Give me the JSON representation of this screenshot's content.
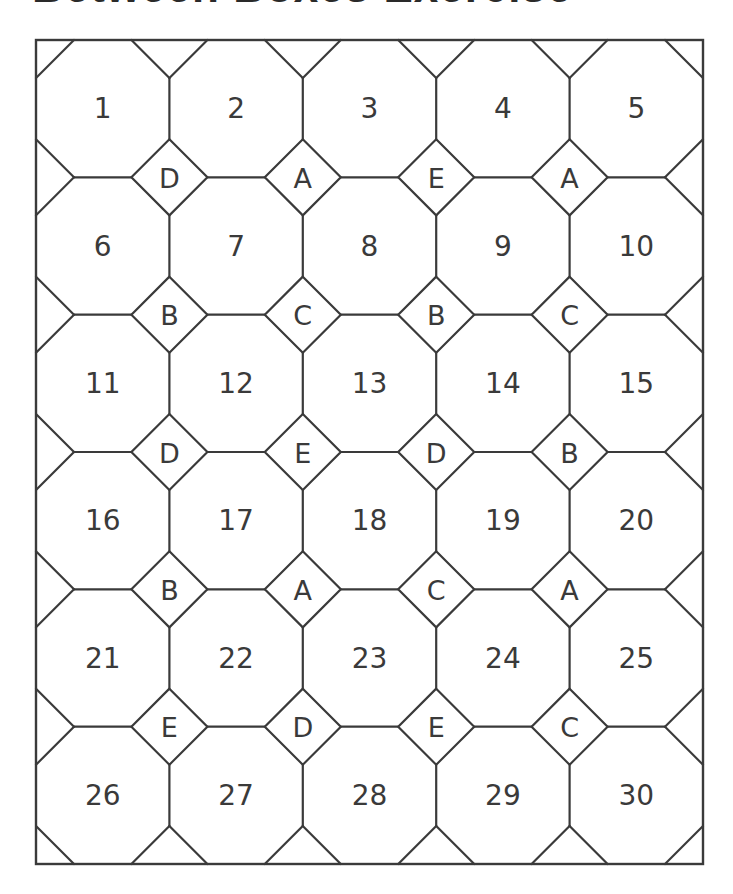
{
  "header": {
    "title": "Between Boxes Exercise",
    "subtitle": ""
  },
  "grid": {
    "columns": 5,
    "rows": 6,
    "left": 36,
    "top": 40,
    "right": 703,
    "bottom": 864,
    "vertex_radius": 38,
    "line_color": "#3a3a3a",
    "background": "#ffffff"
  },
  "cells": [
    [
      "1",
      "2",
      "3",
      "4",
      "5"
    ],
    [
      "6",
      "7",
      "8",
      "9",
      "10"
    ],
    [
      "11",
      "12",
      "13",
      "14",
      "15"
    ],
    [
      "16",
      "17",
      "18",
      "19",
      "20"
    ],
    [
      "21",
      "22",
      "23",
      "24",
      "25"
    ],
    [
      "26",
      "27",
      "28",
      "29",
      "30"
    ]
  ],
  "diamonds": [
    [
      "D",
      "A",
      "E",
      "A"
    ],
    [
      "B",
      "C",
      "B",
      "C"
    ],
    [
      "D",
      "E",
      "D",
      "B"
    ],
    [
      "B",
      "A",
      "C",
      "A"
    ],
    [
      "E",
      "D",
      "E",
      "C"
    ]
  ]
}
